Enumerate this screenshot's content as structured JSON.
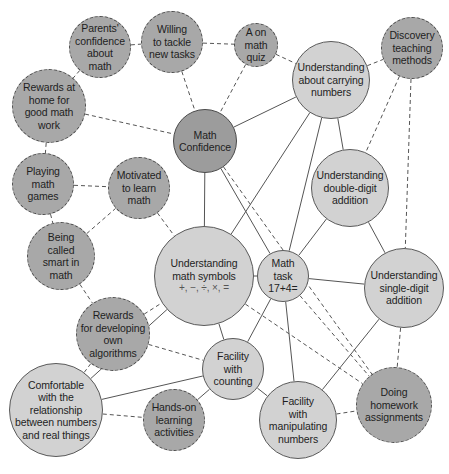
{
  "diagram": {
    "type": "concept-map",
    "colors": {
      "solid_fill": "#d2d2d2",
      "dashed_fill": "#a8a8a8",
      "core_fill": "#9c9c9c",
      "line": "#555555"
    },
    "nodes": [
      {
        "id": "parents",
        "label": "Parents'\nconfidence\nabout\nmath",
        "x": 100,
        "y": 47,
        "r": 31,
        "style": "dashed"
      },
      {
        "id": "willing",
        "label": "Willing\nto tackle\nnew tasks",
        "x": 172,
        "y": 42,
        "r": 31,
        "style": "dashed"
      },
      {
        "id": "quiz",
        "label": "A on\nmath\nquiz",
        "x": 256,
        "y": 45,
        "r": 22,
        "style": "dashed"
      },
      {
        "id": "discovery",
        "label": "Discovery\nteaching\nmethods",
        "x": 412,
        "y": 48,
        "r": 31,
        "style": "dashed"
      },
      {
        "id": "carrying",
        "label": "Understanding\nabout carrying\nnumbers",
        "x": 331,
        "y": 80,
        "r": 39,
        "style": "solid"
      },
      {
        "id": "rewards_home",
        "label": "Rewards at\nhome for\ngood math\nwork",
        "x": 49,
        "y": 106,
        "r": 37,
        "style": "dashed"
      },
      {
        "id": "confidence",
        "label": "Math\nConfidence",
        "x": 205,
        "y": 141,
        "r": 32,
        "style": "core"
      },
      {
        "id": "games",
        "label": "Playing\nmath\ngames",
        "x": 43,
        "y": 184,
        "r": 31,
        "style": "dashed"
      },
      {
        "id": "motivated",
        "label": "Motivated\nto learn\nmath",
        "x": 139,
        "y": 188,
        "r": 31,
        "style": "dashed"
      },
      {
        "id": "double",
        "label": "Understanding\ndouble-digit\naddition",
        "x": 350,
        "y": 188,
        "r": 39,
        "style": "solid"
      },
      {
        "id": "smart",
        "label": "Being\ncalled\nsmart in\nmath",
        "x": 61,
        "y": 256,
        "r": 34,
        "style": "dashed"
      },
      {
        "id": "symbols",
        "label": "Understanding\nmath symbols",
        "sub": "+, −, ÷, ×, =",
        "x": 204,
        "y": 276,
        "r": 50,
        "style": "solid"
      },
      {
        "id": "task",
        "label": "Math\ntask\n17+4=",
        "x": 283,
        "y": 276,
        "r": 26,
        "style": "solid"
      },
      {
        "id": "single",
        "label": "Understanding\nsingle-digit\naddition",
        "x": 404,
        "y": 288,
        "r": 40,
        "style": "solid"
      },
      {
        "id": "algorithms",
        "label": "Rewards\nfor developing\nown\nalgorithms",
        "x": 113,
        "y": 334,
        "r": 37,
        "style": "dashed"
      },
      {
        "id": "counting",
        "label": "Facility\nwith\ncounting",
        "x": 233,
        "y": 369,
        "r": 31,
        "style": "solid"
      },
      {
        "id": "comfortable",
        "label": "Comfortable\nwith the\nrelationship\nbetween numbers\nand real things",
        "x": 56,
        "y": 410,
        "r": 47,
        "style": "solid"
      },
      {
        "id": "handson",
        "label": "Hands-on\nlearning\nactivities",
        "x": 174,
        "y": 420,
        "r": 31,
        "style": "dashed"
      },
      {
        "id": "manipulating",
        "label": "Facility\nwith\nmanipulating\nnumbers",
        "x": 298,
        "y": 420,
        "r": 39,
        "style": "solid"
      },
      {
        "id": "homework",
        "label": "Doing\nhomework\nassignments",
        "x": 394,
        "y": 405,
        "r": 38,
        "style": "dashed"
      }
    ],
    "edges": [
      {
        "from": "parents",
        "to": "willing",
        "style": "dashed"
      },
      {
        "from": "willing",
        "to": "quiz",
        "style": "dashed"
      },
      {
        "from": "parents",
        "to": "rewards_home",
        "style": "dashed"
      },
      {
        "from": "willing",
        "to": "confidence",
        "style": "dashed"
      },
      {
        "from": "quiz",
        "to": "confidence",
        "style": "dashed"
      },
      {
        "from": "quiz",
        "to": "carrying",
        "style": "dashed"
      },
      {
        "from": "carrying",
        "to": "discovery",
        "style": "dashed"
      },
      {
        "from": "rewards_home",
        "to": "confidence",
        "style": "dashed"
      },
      {
        "from": "rewards_home",
        "to": "games",
        "style": "dashed"
      },
      {
        "from": "games",
        "to": "motivated",
        "style": "dashed"
      },
      {
        "from": "games",
        "to": "smart",
        "style": "dashed"
      },
      {
        "from": "smart",
        "to": "motivated",
        "style": "dashed"
      },
      {
        "from": "motivated",
        "to": "symbols",
        "style": "dashed"
      },
      {
        "from": "smart",
        "to": "algorithms",
        "style": "dashed"
      },
      {
        "from": "algorithms",
        "to": "symbols",
        "style": "dashed"
      },
      {
        "from": "algorithms",
        "to": "counting",
        "style": "dashed"
      },
      {
        "from": "algorithms",
        "to": "comfortable",
        "style": "dashed"
      },
      {
        "from": "comfortable",
        "to": "handson",
        "style": "dashed"
      },
      {
        "from": "manipulating",
        "to": "homework",
        "style": "dashed"
      },
      {
        "from": "single",
        "to": "homework",
        "style": "dashed"
      },
      {
        "from": "discovery",
        "to": "double",
        "style": "dashed"
      },
      {
        "from": "discovery",
        "to": "single",
        "style": "dashed"
      },
      {
        "from": "confidence",
        "to": "homework",
        "style": "dashed"
      },
      {
        "from": "symbols",
        "to": "homework",
        "style": "dashed"
      },
      {
        "from": "task",
        "to": "homework",
        "style": "dashed"
      },
      {
        "from": "confidence",
        "to": "carrying",
        "style": "solid"
      },
      {
        "from": "confidence",
        "to": "symbols",
        "style": "solid"
      },
      {
        "from": "confidence",
        "to": "task",
        "style": "solid"
      },
      {
        "from": "carrying",
        "to": "symbols",
        "style": "solid"
      },
      {
        "from": "carrying",
        "to": "task",
        "style": "solid"
      },
      {
        "from": "carrying",
        "to": "double",
        "style": "solid"
      },
      {
        "from": "double",
        "to": "task",
        "style": "solid"
      },
      {
        "from": "double",
        "to": "single",
        "style": "solid"
      },
      {
        "from": "symbols",
        "to": "task",
        "style": "solid"
      },
      {
        "from": "task",
        "to": "single",
        "style": "solid"
      },
      {
        "from": "symbols",
        "to": "counting",
        "style": "solid"
      },
      {
        "from": "symbols",
        "to": "comfortable",
        "style": "solid"
      },
      {
        "from": "task",
        "to": "counting",
        "style": "solid"
      },
      {
        "from": "task",
        "to": "manipulating",
        "style": "solid"
      },
      {
        "from": "counting",
        "to": "comfortable",
        "style": "solid"
      },
      {
        "from": "counting",
        "to": "handson",
        "style": "solid"
      },
      {
        "from": "counting",
        "to": "manipulating",
        "style": "solid"
      },
      {
        "from": "single",
        "to": "manipulating",
        "style": "solid"
      }
    ]
  }
}
